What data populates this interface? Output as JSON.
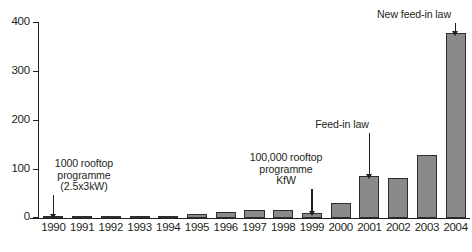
{
  "chart_data": {
    "type": "bar",
    "title": "",
    "xlabel": "",
    "ylabel": "",
    "ylim": [
      0,
      400
    ],
    "yticks": [
      0,
      100,
      200,
      300,
      400
    ],
    "grid": false,
    "legend": null,
    "categories": [
      "1990",
      "1991",
      "1992",
      "1993",
      "1994",
      "1995",
      "1996",
      "1997",
      "1998",
      "1999",
      "2000",
      "2001",
      "2002",
      "2003",
      "2004"
    ],
    "values": [
      4,
      3,
      3,
      3,
      4,
      9,
      12,
      17,
      16,
      11,
      30,
      86,
      82,
      128,
      377
    ],
    "annotations": [
      {
        "id": "annot-1990",
        "text": "1000 rooftop\nprogramme\n(2.5x3kW)",
        "target_category": "1990"
      },
      {
        "id": "annot-1999",
        "text": "100,000 rooftop\nprogramme\nKfW",
        "target_category": "1999"
      },
      {
        "id": "annot-2001",
        "text": "Feed-in law",
        "target_category": "2001"
      },
      {
        "id": "annot-2004",
        "text": "New feed-in law",
        "target_category": "2004"
      }
    ]
  },
  "colors": {
    "bar_fill": "#8a8a8a",
    "bar_stroke": "#2e2e2e",
    "axis": "#231f20",
    "background": "#ffffff"
  }
}
